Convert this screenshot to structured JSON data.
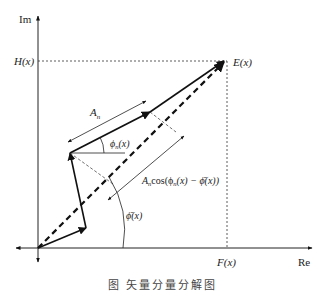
{
  "diagram": {
    "type": "phasor-diagram",
    "axes": {
      "x_label": "Re",
      "y_label": "Im"
    },
    "projections": {
      "h_label": "H(x)",
      "f_label": "F(x)"
    },
    "resultant": {
      "label": "E(x)"
    },
    "component": {
      "amplitude_label": "A",
      "amplitude_subscript": "n",
      "phase_label_prefix": "ϕ",
      "phase_label_subscript": "n",
      "phase_label_suffix": "(x)"
    },
    "projection_length": {
      "label_prefix": "A",
      "label_subscript": "n",
      "label_body": "cos(ϕ",
      "label_sub2": "n",
      "label_tail": "(x) − ϕ̄(x))"
    },
    "mean_phase": {
      "label": "ϕ̄(x)"
    }
  },
  "caption": "图        矢量分量分解图"
}
